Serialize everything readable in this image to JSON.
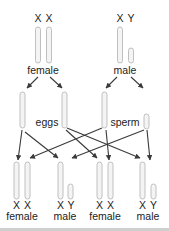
{
  "diagram": {
    "parents": {
      "female": {
        "label": "female",
        "chromosomes": [
          "X",
          "X"
        ]
      },
      "male": {
        "label": "male",
        "chromosomes": [
          "X",
          "Y"
        ]
      }
    },
    "gametes": {
      "eggs": {
        "label": "eggs",
        "chromosomes": [
          "X",
          "X"
        ]
      },
      "sperm": {
        "label": "sperm",
        "chromosomes": [
          "X",
          "Y"
        ]
      }
    },
    "offspring": [
      {
        "label": "female",
        "chromosomes": [
          "X",
          "X"
        ]
      },
      {
        "label": "male",
        "chromosomes": [
          "X",
          "Y"
        ]
      },
      {
        "label": "female",
        "chromosomes": [
          "X",
          "X"
        ]
      },
      {
        "label": "male",
        "chromosomes": [
          "X",
          "Y"
        ]
      }
    ],
    "colors": {
      "chromosome_fill": "#f4f4f4",
      "chromosome_stroke": "#b9b9b9",
      "arrow": "#3a3a3a",
      "text": "#222222",
      "rule": "#cfcfcf"
    }
  }
}
